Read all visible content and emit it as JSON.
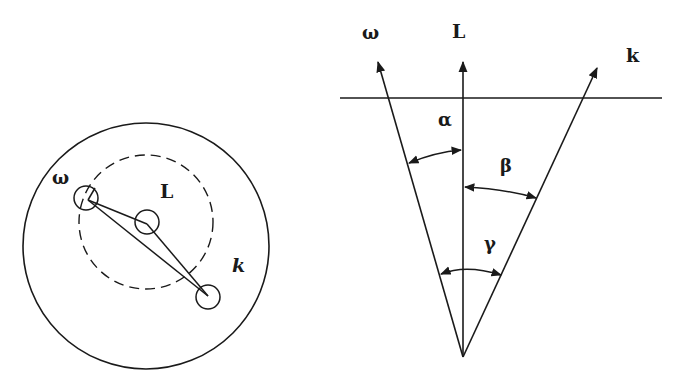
{
  "left_diagram": {
    "labels": {
      "omega": "ω",
      "L": "L",
      "k": "k"
    },
    "outer_circle": {
      "cx": 146,
      "cy": 246,
      "r": 123
    },
    "dashed_circle": {
      "cx": 146,
      "cy": 222,
      "r": 67
    },
    "nodes": [
      {
        "name": "omega",
        "cx": 86,
        "cy": 198,
        "r": 12
      },
      {
        "name": "L",
        "cx": 147,
        "cy": 222,
        "r": 12
      },
      {
        "name": "k",
        "cx": 208,
        "cy": 297,
        "r": 12
      }
    ]
  },
  "right_diagram": {
    "labels": {
      "omega": "ω",
      "L": "L",
      "k": "k",
      "alpha": "α",
      "beta": "β",
      "gamma": "γ"
    },
    "apex": {
      "x": 463,
      "y": 357
    },
    "horizontal_line_y": 98,
    "stroke_color": "#1a1a1a"
  }
}
